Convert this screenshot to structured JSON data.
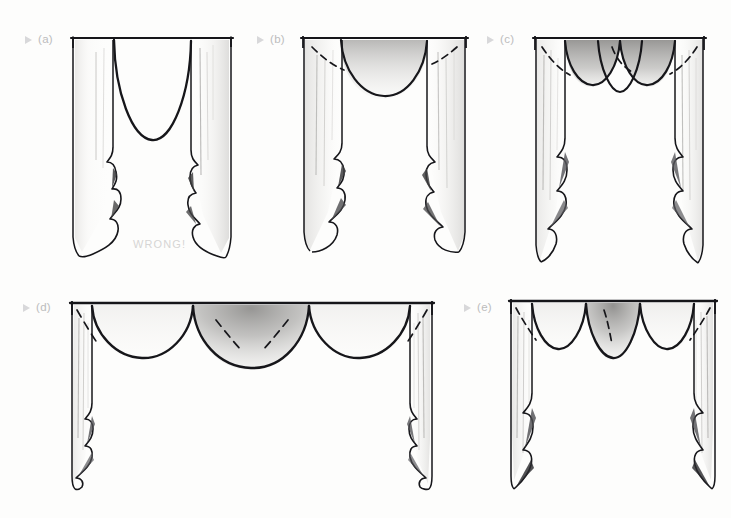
{
  "page": {
    "background_color": "#fdfdfc",
    "ink_color": "#16161a",
    "label_color": "#bcbcbd",
    "marker_color": "#d8d8da",
    "shade_color": "#9b9a98",
    "note_color": "#d6d5d4",
    "running_head": "",
    "width": 731,
    "height": 518
  },
  "figures": [
    {
      "id": "a",
      "label": "(a)",
      "marker": "play-triangle",
      "caption_note": "WRONG!",
      "description": "Single deep U-shaped center swag between two straight cascading jabots",
      "swag_count": 1,
      "x": 73,
      "y": 38,
      "width": 158,
      "height": 222
    },
    {
      "id": "b",
      "label": "(b)",
      "marker": "play-triangle",
      "caption_note": "",
      "description": "Single shallow shaded swag with dashed guide lines and cascading jabots",
      "swag_count": 1,
      "x": 303,
      "y": 38,
      "width": 163,
      "height": 222
    },
    {
      "id": "c",
      "label": "(c)",
      "marker": "play-triangle",
      "caption_note": "",
      "description": "Three scalloped swags with shaded outer swags and dashed guide lines",
      "swag_count": 3,
      "x": 535,
      "y": 38,
      "width": 168,
      "height": 234
    },
    {
      "id": "d",
      "label": "(d)",
      "marker": "play-triangle",
      "caption_note": "",
      "description": "Wide treatment with three large swags, center swag heavily shaded, narrow side jabots",
      "swag_count": 3,
      "x": 72,
      "y": 303,
      "width": 392,
      "height": 185
    },
    {
      "id": "e",
      "label": "(e)",
      "marker": "play-triangle",
      "caption_note": "",
      "description": "Three swags with shaded center swag and long cascading side jabots",
      "swag_count": 3,
      "x": 511,
      "y": 300,
      "width": 205,
      "height": 192
    }
  ]
}
